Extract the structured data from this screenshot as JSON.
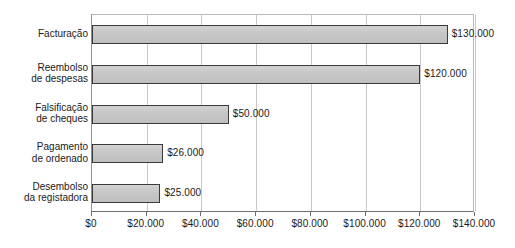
{
  "chart_data": {
    "type": "bar",
    "orientation": "horizontal",
    "title": "",
    "xlabel": "",
    "ylabel": "",
    "categories": [
      "Facturação",
      "Reembolso\nde despesas",
      "Falsificação\nde cheques",
      "Pagamento\nde ordenado",
      "Desembolso\nda registadora"
    ],
    "values": [
      130000,
      120000,
      50000,
      26000,
      25000
    ],
    "value_labels": [
      "$130.000",
      "$120.000",
      "$50.000",
      "$26.000",
      "$25.000"
    ],
    "xlim": [
      0,
      140000
    ],
    "xtick_values": [
      0,
      20000,
      40000,
      60000,
      80000,
      100000,
      120000,
      140000
    ],
    "xtick_labels": [
      "$0",
      "$20.000",
      "$40.000",
      "$60.000",
      "$80.000",
      "$100.000",
      "$120.000",
      "$140.000"
    ],
    "grid": true,
    "grid_axis": "x",
    "legend": false,
    "bar_fill_color": "#c8c8c8",
    "bar_border_color": "#3a3a3a",
    "gridline_color": "#c9c9c9",
    "axis_color": "#6e6e6e",
    "text_color": "#1a1a1a"
  }
}
